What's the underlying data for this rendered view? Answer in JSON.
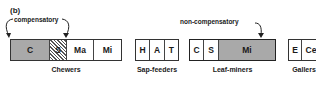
{
  "panel_label": "(b)",
  "annotations": {
    "compensatory": "compensatory",
    "non_compensatory": "non-compensatory"
  },
  "groups": [
    {
      "name": "Chewers",
      "cells": [
        "C",
        "S",
        "Ma",
        "Mi"
      ]
    },
    {
      "name": "Sap-feeders",
      "cells": [
        "H",
        "A",
        "T"
      ]
    },
    {
      "name": "Leaf-miners",
      "cells": [
        "C",
        "S",
        "Mi"
      ]
    },
    {
      "name": "Gallers",
      "cells": [
        "E",
        "Ce"
      ]
    }
  ],
  "colors": {
    "shaded": "#a9a9a9",
    "border": "#333333"
  }
}
